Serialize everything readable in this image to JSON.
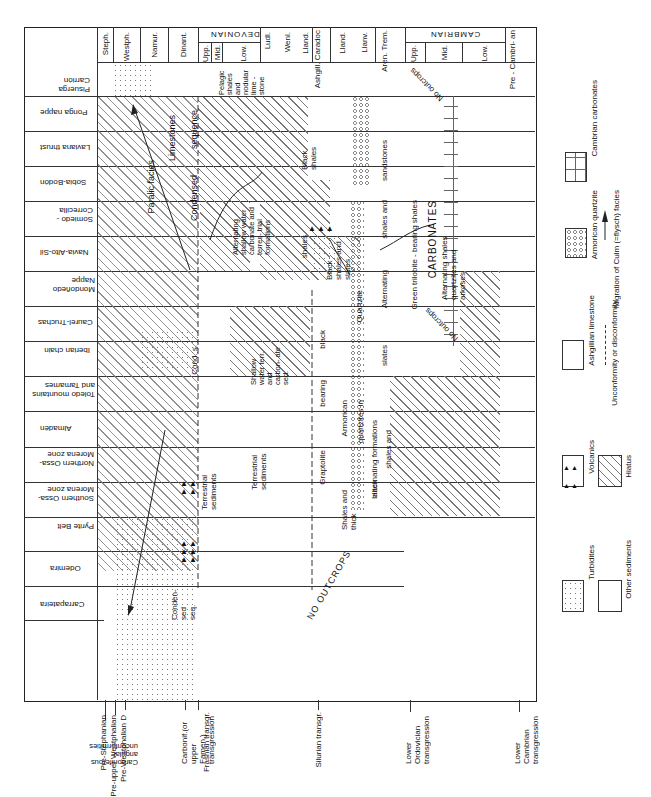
{
  "header": {
    "periods": [
      {
        "label": "Steph."
      },
      {
        "label": "Westph."
      },
      {
        "label": "Namur."
      },
      {
        "label": "Dinant."
      },
      {
        "label": "DEVONIAN",
        "sub": [
          "Upp.",
          "Mid.",
          "Low."
        ]
      },
      {
        "label": "Ludl."
      },
      {
        "label": "Wenl."
      },
      {
        "label": "Lland."
      },
      {
        "label": "Ashgill. Caradoc"
      },
      {
        "label": "Lland."
      },
      {
        "label": "Llanv."
      },
      {
        "label": "Aren. Trem."
      },
      {
        "label": "CAMBRIAN",
        "sub": [
          "Upp.",
          "Mid.",
          "Low."
        ]
      },
      {
        "label": "Pre - Cambri- an"
      }
    ]
  },
  "regions": [
    "Pisuerga Carrión",
    "Ponga nappe",
    "Laviana thrust",
    "Sobia-Bodón",
    "Somiedo - Correcilla",
    "Navia-Alto-Sil",
    "Mondoñedo Nappe",
    "Caurel-Truchas",
    "Iberian chain",
    "Toledo mountains and Tamames",
    "Almadén",
    "Northern Ossa-Morena zone",
    "Southern Ossa-Morena zone",
    "Pyrite Belt",
    "Odemira",
    "Carrapateira"
  ],
  "annotations": {
    "paralic_facies": "Paralic facies",
    "limestones": "Limestones",
    "sequence": "sequence",
    "condensed": "Condensed",
    "pelagic": "Pelagic shales and nodular lime - stone",
    "alternating_shallow": "Alternating shallow water carbonate and terres- trial formations",
    "black_shales_1": "Black shales",
    "sandstones": "sandstones",
    "no_outcrops_top": "No outcrops",
    "shales_1": "shales",
    "black_shales_slates": "Black shales and slates",
    "shales_and": "shales and",
    "alternating_1": "Alternating",
    "green_trilobite": "Green trilobite - bearing shales",
    "carbonates": "CARBONATES",
    "alternating_shales": "Alternating shales quartzites and arkoses",
    "no_outcrops_mid": "No outcrops",
    "cond_s": "Cond. s.",
    "shallow_water": "Shallow water terr. and carbon- ate sed.",
    "black": "black",
    "quartzite": "Quartzite",
    "slates": "slates",
    "bearing": "bearing",
    "quartzites_in": "quartzites in",
    "alternating_formations": "alternating formations",
    "shales_and_2": "shales and",
    "armorican": "Armorican",
    "graptolite": "Graptolite",
    "shales_and_thick": "Shales and thick",
    "black_2": "black",
    "terrestrial_1": "Terrestrial sediments",
    "terrestrial_2": "Terrestrial sediments",
    "no_outcrops_bottom": "NO OUTCROPS",
    "condensed_seq": "Conden- sed seq.",
    "question": "?"
  },
  "bottom_labels": {
    "pre_stephanian": "Pre-Stephanian",
    "pre_upper_westphalian": "Pre-upper Westphalian",
    "pre_westphalian_d": "Pre-Westphalian D",
    "carboniferous_group": "Carboniferous angular unconformities",
    "carbonif_transgression": "Carbonif.(or upper Famen.) transgression",
    "frasnian": "Frasnian transgr.",
    "silurian": "Silurian transgr.",
    "lower_ordovician": "Lower Ordovician transgression",
    "lower_cambrian": "Lower Cambrian transgression"
  },
  "legend": {
    "items": [
      {
        "key": "cambrian_carbonates",
        "label": "Cambrian carbonates"
      },
      {
        "key": "armorican_quartzite",
        "label": "Armorican quartzite"
      },
      {
        "key": "migration",
        "label": "Migration of Culm (=flysch) facies"
      },
      {
        "key": "ashgillian",
        "label": "Ashgillian limestone"
      },
      {
        "key": "unconformity",
        "label": "Unconformity or disconformity"
      },
      {
        "key": "volcanics",
        "label": "Volcanics"
      },
      {
        "key": "hiatus",
        "label": "Hiatus"
      },
      {
        "key": "turbidites",
        "label": "Turbidites"
      },
      {
        "key": "other",
        "label": "Other sediments"
      }
    ]
  }
}
